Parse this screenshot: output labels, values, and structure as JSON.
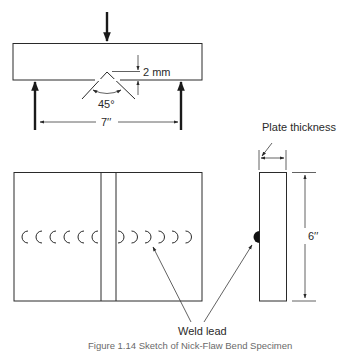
{
  "figure": {
    "top_view": {
      "notch_depth_label": "2 mm",
      "notch_angle_label": "45°",
      "span_label": "7′′"
    },
    "side_view": {
      "thickness_label": "Plate thickness",
      "height_label": "6′′"
    },
    "weld_label": "Weld lead",
    "caption": "Figure 1.14  Sketch of Nick-Flaw Bend Specimen",
    "weld_marks": {
      "left_count": 6,
      "right_count": 6
    },
    "icons": {
      "load_arrow": "arrow-down-icon",
      "support_arrow": "arrow-up-icon"
    }
  }
}
